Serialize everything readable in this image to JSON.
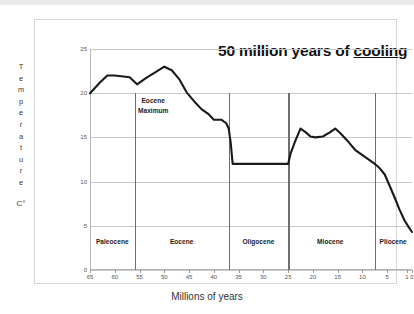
{
  "chart_data": {
    "type": "line",
    "title": "50 million years of cooling",
    "title_plain": "50 million years of ",
    "title_underlined": "cooling",
    "xlabel": "Millions of years",
    "ylabel": "Temperature",
    "ylabel_letters": [
      "T",
      "e",
      "m",
      "p",
      "e",
      "r",
      "a",
      "t",
      "u",
      "r",
      "e"
    ],
    "yunit": "C°",
    "xlim": [
      65,
      0
    ],
    "ylim": [
      0,
      25
    ],
    "x_reversed": true,
    "grid": true,
    "legend": "none",
    "xticks": [
      65,
      60,
      55,
      50,
      45,
      40,
      35,
      30,
      25,
      20,
      15,
      10,
      5,
      1,
      0
    ],
    "xtick_labels": [
      "65",
      "60",
      "55",
      "50",
      "45",
      "40",
      "35",
      "30",
      "25",
      "20",
      "15",
      "10",
      "5",
      "1",
      "0"
    ],
    "yticks": [
      0,
      5,
      10,
      15,
      20,
      25
    ],
    "ytick_labels": [
      "0",
      "5",
      "10",
      "15",
      "20",
      "25"
    ],
    "series": [
      {
        "name": "Global temperature",
        "color": "#1a1a1a",
        "x": [
          65,
          63,
          61.5,
          60,
          57,
          55.5,
          53.5,
          52,
          50,
          48.5,
          47,
          45.5,
          44,
          42.5,
          41,
          40,
          38.5,
          37.5,
          37,
          36.6,
          36.2,
          25.4,
          25,
          24.5,
          23.5,
          22.5,
          21.5,
          20.5,
          19.5,
          18,
          16.5,
          15.5,
          14.5,
          13,
          11.5,
          10,
          8.5,
          7.5,
          6.5,
          5.5,
          4.5,
          3.5,
          2.5,
          1.5,
          0.6,
          0
        ],
        "y": [
          20,
          21.2,
          22,
          22,
          21.8,
          21,
          21.8,
          22.3,
          23,
          22.6,
          21.6,
          20.1,
          19.1,
          18.2,
          17.6,
          17,
          17,
          16.6,
          16,
          14.4,
          12,
          12,
          12,
          13.2,
          14.7,
          16,
          15.6,
          15.1,
          15,
          15.1,
          15.6,
          16,
          15.5,
          14.6,
          13.6,
          13,
          12.4,
          12,
          11.5,
          10.8,
          9.5,
          8.2,
          6.8,
          5.6,
          4.8,
          4.3
        ]
      }
    ],
    "annotations": [
      {
        "name": "eocene-maximum",
        "line1": "Eocene",
        "line2": "Maximum",
        "x": 51,
        "y": 18.8
      }
    ],
    "epochs": [
      {
        "label": "Paleocene",
        "start": 65,
        "end": 56,
        "center": 60.5
      },
      {
        "label": "Eocene",
        "start": 56,
        "end": 37,
        "center": 46.5
      },
      {
        "label": "Oligocene",
        "start": 37,
        "end": 25,
        "center": 31
      },
      {
        "label": "Miocene",
        "start": 25,
        "end": 7.5,
        "center": 16.5
      },
      {
        "label": "Pliocene",
        "start": 7.5,
        "end": 0,
        "center": 3.8
      }
    ],
    "epoch_dividers": [
      56,
      37,
      25,
      7.5
    ],
    "epoch_label_y": 3.2,
    "colors": {
      "line": "#1a1a1a",
      "grid": "#c8c8c8",
      "axis": "#b5b5b5",
      "divider": "#6e6e6e",
      "frame": "#d6d6d6",
      "text": "#333333",
      "background": "#ffffff"
    }
  }
}
